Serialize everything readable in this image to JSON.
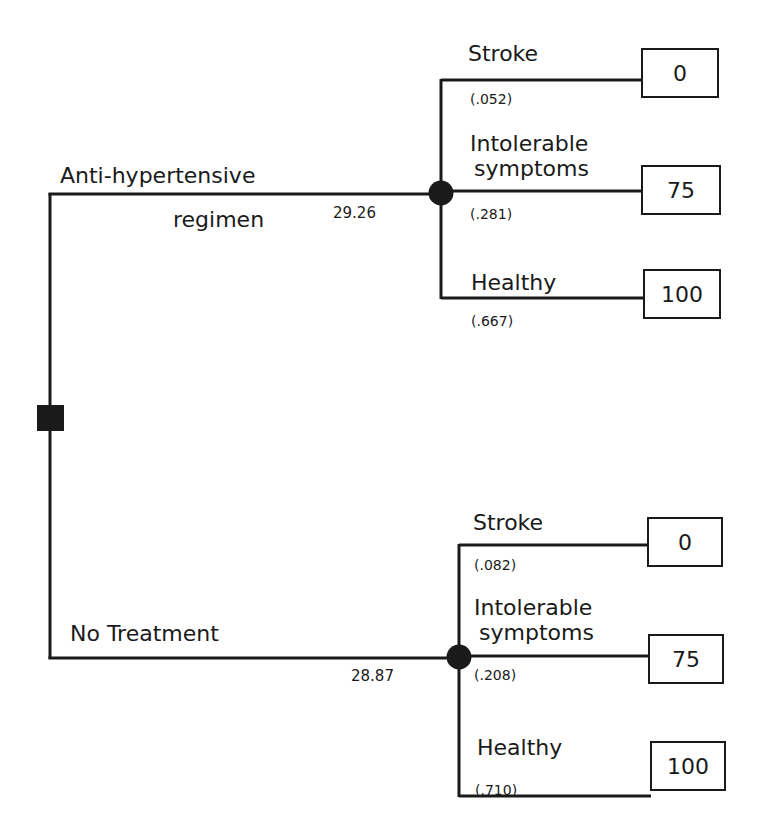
{
  "diagram": {
    "type": "decision-tree",
    "decision_node": {
      "shape": "square"
    },
    "branches": [
      {
        "label_line1": "Anti-hypertensive",
        "label_line2": "regimen",
        "expected_value": "29.26",
        "outcomes": [
          {
            "label": "Stroke",
            "probability": "(.052)",
            "utility": "0"
          },
          {
            "label_line1": "Intolerable",
            "label_line2": "symptoms",
            "probability": "(.281)",
            "utility": "75"
          },
          {
            "label": "Healthy",
            "probability": "(.667)",
            "utility": "100"
          }
        ]
      },
      {
        "label": "No Treatment",
        "expected_value": "28.87",
        "outcomes": [
          {
            "label": "Stroke",
            "probability": "(.082)",
            "utility": "0"
          },
          {
            "label_line1": "Intolerable",
            "label_line2": "symptoms",
            "probability": "(.208)",
            "utility": "75"
          },
          {
            "label": "Healthy",
            "probability": "(.710)",
            "utility": "100"
          }
        ]
      }
    ],
    "colors": {
      "line": "#1a1a1a",
      "background": "#ffffff"
    }
  }
}
